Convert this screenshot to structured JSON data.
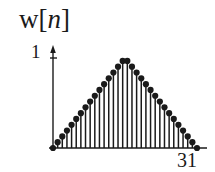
{
  "figure": {
    "ylabel": "w[",
    "ylabel_var": "n",
    "ylabel_close": "]",
    "y_tick_label": "1",
    "x_end_label": "31",
    "ink_color": "#1a1a1a",
    "background_color": "#ffffff"
  },
  "chart_data": {
    "type": "line",
    "plot_style": "stem",
    "title": "w[n]",
    "xlabel": "",
    "ylabel": "w[n]",
    "grid": false,
    "legend": null,
    "xlim": [
      0,
      31
    ],
    "ylim": [
      0,
      1
    ],
    "xticks": [
      31
    ],
    "xtick_labels": [
      "31"
    ],
    "yticks": [
      1
    ],
    "ytick_labels": [
      "1"
    ],
    "x": [
      0,
      1,
      2,
      3,
      4,
      5,
      6,
      7,
      8,
      9,
      10,
      11,
      12,
      13,
      14,
      15,
      16,
      17,
      18,
      19,
      20,
      21,
      22,
      23,
      24,
      25,
      26,
      27,
      28,
      29,
      30,
      31
    ],
    "values": [
      0.0,
      0.0645,
      0.129,
      0.1935,
      0.258,
      0.3226,
      0.3871,
      0.4516,
      0.5161,
      0.5806,
      0.6452,
      0.7097,
      0.7742,
      0.8387,
      0.9032,
      0.9677,
      0.9677,
      0.9032,
      0.8387,
      0.7742,
      0.7097,
      0.6452,
      0.5806,
      0.5161,
      0.4516,
      0.3871,
      0.3226,
      0.258,
      0.1935,
      0.129,
      0.0645,
      0.0
    ]
  },
  "geometry": {
    "origin_x": 53,
    "baseline_y": 148,
    "axis_right_x": 207,
    "axis_top_y": 47,
    "unit_y": 58,
    "plot_right_x": 197
  }
}
